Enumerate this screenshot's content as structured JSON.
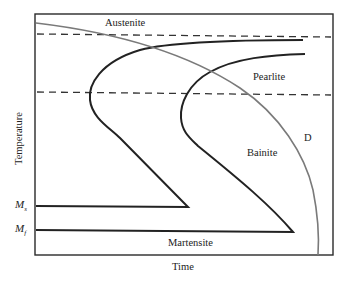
{
  "diagram": {
    "type": "TTT / CCT diagram",
    "axes": {
      "x_label": "Time",
      "y_label": "Temperature"
    },
    "regions": {
      "austenite": "Austenite",
      "pearlite": "Pearlite",
      "bainite": "Bainite",
      "martensite": "Martensite"
    },
    "curve_labels": {
      "cooling_curve": "D"
    },
    "temperature_marks": {
      "ms": {
        "base": "M",
        "sub": "s"
      },
      "mf": {
        "base": "M",
        "sub": "f"
      }
    },
    "colors": {
      "frame": "#2a2a2a",
      "transformation_curves": "#222222",
      "cooling_curve": "#7a7a7a",
      "dashed_lines": "#333333"
    }
  }
}
